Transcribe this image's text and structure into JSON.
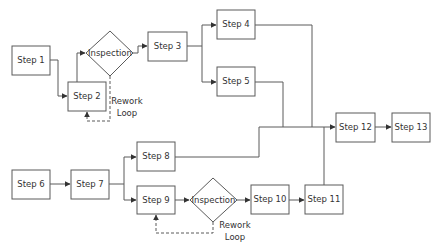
{
  "diagram": {
    "type": "process-flowchart",
    "nodes": [
      {
        "id": "s1",
        "kind": "process",
        "label": "Step 1"
      },
      {
        "id": "s2",
        "kind": "process",
        "label": "Step 2"
      },
      {
        "id": "i1",
        "kind": "decision",
        "label": "Inspection"
      },
      {
        "id": "s3",
        "kind": "process",
        "label": "Step 3"
      },
      {
        "id": "s4",
        "kind": "process",
        "label": "Step 4"
      },
      {
        "id": "s5",
        "kind": "process",
        "label": "Step 5"
      },
      {
        "id": "s6",
        "kind": "process",
        "label": "Step 6"
      },
      {
        "id": "s7",
        "kind": "process",
        "label": "Step 7"
      },
      {
        "id": "s8",
        "kind": "process",
        "label": "Step 8"
      },
      {
        "id": "s9",
        "kind": "process",
        "label": "Step 9"
      },
      {
        "id": "i2",
        "kind": "decision",
        "label": "Inspection"
      },
      {
        "id": "s10",
        "kind": "process",
        "label": "Step 10"
      },
      {
        "id": "s11",
        "kind": "process",
        "label": "Step 11"
      },
      {
        "id": "s12",
        "kind": "process",
        "label": "Step 12"
      },
      {
        "id": "s13",
        "kind": "process",
        "label": "Step 13"
      }
    ],
    "edges": [
      {
        "from": "s1",
        "to": "s2",
        "style": "solid"
      },
      {
        "from": "s2",
        "to": "i1",
        "style": "solid"
      },
      {
        "from": "i1",
        "to": "s3",
        "style": "solid"
      },
      {
        "from": "i1",
        "to": "s2",
        "style": "dashed",
        "label": "Rework Loop"
      },
      {
        "from": "s3",
        "to": "s4",
        "style": "solid"
      },
      {
        "from": "s3",
        "to": "s5",
        "style": "solid"
      },
      {
        "from": "s4",
        "to": "s12",
        "style": "solid"
      },
      {
        "from": "s5",
        "to": "s12",
        "style": "solid"
      },
      {
        "from": "s6",
        "to": "s7",
        "style": "solid"
      },
      {
        "from": "s7",
        "to": "s8",
        "style": "solid"
      },
      {
        "from": "s7",
        "to": "s9",
        "style": "solid"
      },
      {
        "from": "s8",
        "to": "s12",
        "style": "solid"
      },
      {
        "from": "s9",
        "to": "i2",
        "style": "solid"
      },
      {
        "from": "i2",
        "to": "s10",
        "style": "solid"
      },
      {
        "from": "i2",
        "to": "s9",
        "style": "dashed",
        "label": "Rework Loop"
      },
      {
        "from": "s10",
        "to": "s11",
        "style": "solid"
      },
      {
        "from": "s11",
        "to": "s12",
        "style": "solid"
      },
      {
        "from": "s12",
        "to": "s13",
        "style": "solid"
      }
    ],
    "annotations": {
      "rework_loop_1": [
        "Rework",
        "Loop"
      ],
      "rework_loop_2": [
        "Rework",
        "Loop"
      ]
    }
  }
}
